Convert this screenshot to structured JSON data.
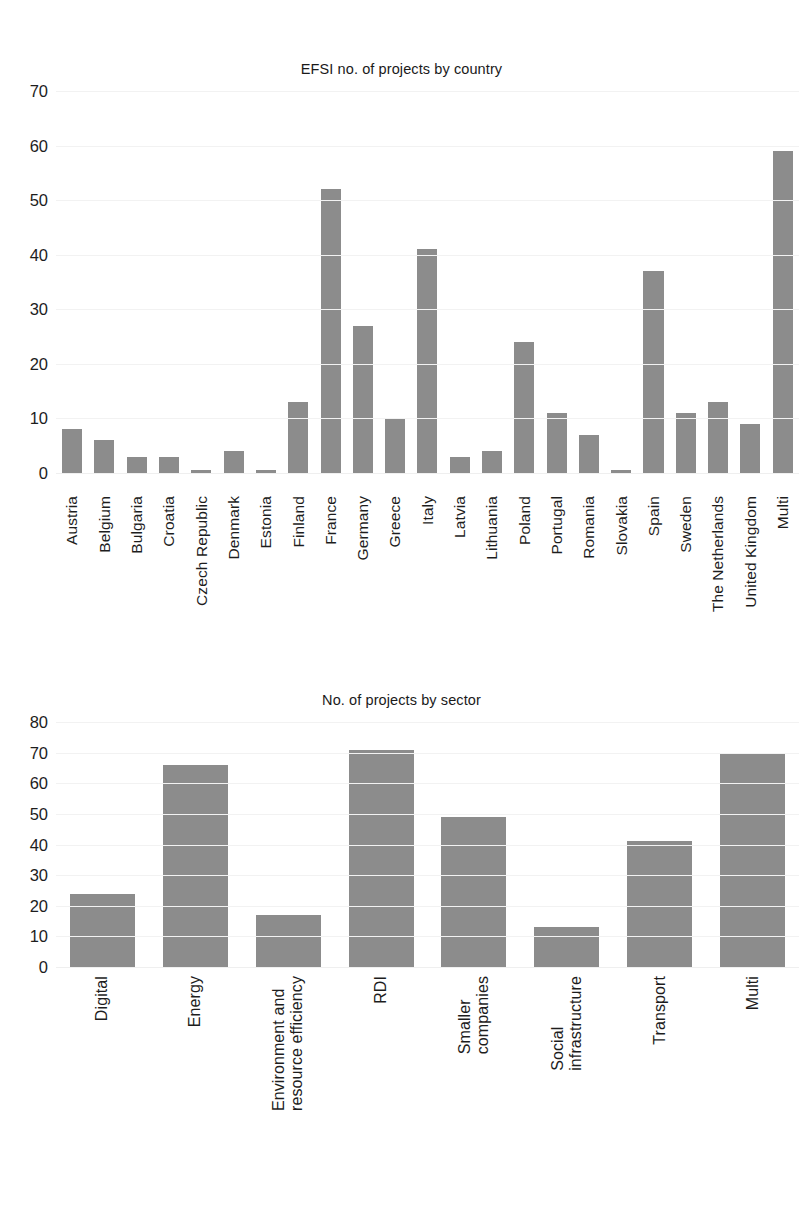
{
  "page": {
    "background_color": "#ffffff",
    "bar_color": "#8c8c8c",
    "gridline_color": "#f2f2f2",
    "text_color": "#1d1d1d"
  },
  "chart_data": [
    {
      "type": "bar",
      "title": "EFSI no. of projects by country",
      "xlabel": "",
      "ylabel": "",
      "ylim": [
        0,
        70
      ],
      "yticks": [
        0,
        10,
        20,
        30,
        40,
        50,
        60,
        70
      ],
      "ytick_labels": [
        "0",
        "10",
        "20",
        "30",
        "40",
        "50",
        "60",
        "70"
      ],
      "grid": true,
      "legend": "none",
      "categories": [
        "Austria",
        "Belgium",
        "Bulgaria",
        "Croatia",
        "Czech Republic",
        "Denmark",
        "Estonia",
        "Finland",
        "France",
        "Germany",
        "Greece",
        "Italy",
        "Latvia",
        "Lithuania",
        "Poland",
        "Portugal",
        "Romania",
        "Slovakia",
        "Spain",
        "Sweden",
        "The Netherlands",
        "United Kingdom",
        "Multi"
      ],
      "values": [
        8,
        6,
        3,
        3,
        0.5,
        4,
        0.5,
        13,
        52,
        27,
        10,
        41,
        3,
        4,
        24,
        11,
        7,
        0.5,
        37,
        11,
        13,
        9,
        59
      ]
    },
    {
      "type": "bar",
      "title": "No. of projects by sector",
      "xlabel": "",
      "ylabel": "",
      "ylim": [
        0,
        80
      ],
      "yticks": [
        0,
        10,
        20,
        30,
        40,
        50,
        60,
        70,
        80
      ],
      "ytick_labels": [
        "0",
        "10",
        "20",
        "30",
        "40",
        "50",
        "60",
        "70",
        "80"
      ],
      "grid": true,
      "legend": "none",
      "categories": [
        "Digital",
        "Energy",
        "Environment and\nresource efficiency",
        "RDI",
        "Smaller\ncompanies",
        "Social\ninfrastructure",
        "Transport",
        "Multi"
      ],
      "values": [
        24,
        66,
        17,
        71,
        49,
        13,
        41,
        70
      ]
    }
  ]
}
